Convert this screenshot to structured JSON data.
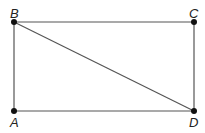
{
  "diagram": {
    "type": "rectangle-with-diagonal",
    "points": [
      {
        "label": "A",
        "x": 14,
        "y": 111
      },
      {
        "label": "B",
        "x": 14,
        "y": 22
      },
      {
        "label": "C",
        "x": 194,
        "y": 22
      },
      {
        "label": "D",
        "x": 194,
        "y": 111
      }
    ],
    "segments": [
      [
        "A",
        "B"
      ],
      [
        "B",
        "C"
      ],
      [
        "C",
        "D"
      ],
      [
        "D",
        "A"
      ],
      [
        "B",
        "D"
      ]
    ],
    "colors": {
      "line": "#555555",
      "point": "#111111",
      "label": "#222222"
    }
  }
}
